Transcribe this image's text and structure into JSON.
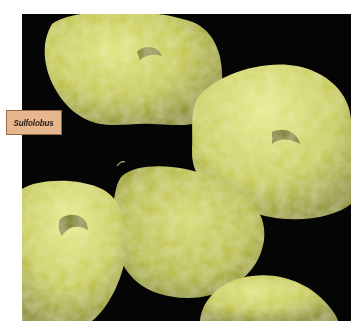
{
  "figure": {
    "label": "Sulfolobus",
    "colors": {
      "background": "#050505",
      "cell_base": "#c8cc5a",
      "cell_highlight": "#e6ea8e",
      "cell_shadow": "#7e8228",
      "label_fill": "#e6b68e",
      "label_border": "#9a6a48"
    }
  }
}
